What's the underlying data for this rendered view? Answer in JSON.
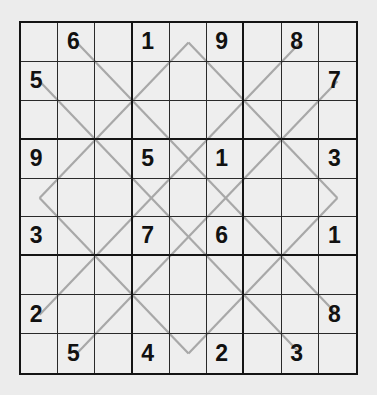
{
  "puzzle": {
    "type": "sudoku",
    "size": 9,
    "colors": {
      "background": "#ececec",
      "grid_line": "#2a2a2a",
      "box_line": "#141414",
      "diagonal_line": "#a8a8a8",
      "digit": "#111111"
    },
    "grid": [
      [
        "",
        "6",
        "",
        "1",
        "",
        "9",
        "",
        "8",
        ""
      ],
      [
        "5",
        "",
        "",
        "",
        "",
        "",
        "",
        "",
        "7"
      ],
      [
        "",
        "",
        "",
        "",
        "",
        "",
        "",
        "",
        ""
      ],
      [
        "9",
        "",
        "",
        "5",
        "",
        "1",
        "",
        "",
        "3"
      ],
      [
        "",
        "",
        "",
        "",
        "",
        "",
        "",
        "",
        ""
      ],
      [
        "3",
        "",
        "",
        "7",
        "",
        "6",
        "",
        "",
        "1"
      ],
      [
        "",
        "",
        "",
        "",
        "",
        "",
        "",
        "",
        ""
      ],
      [
        "2",
        "",
        "",
        "",
        "",
        "",
        "",
        "",
        "8"
      ],
      [
        "",
        "5",
        "",
        "4",
        "",
        "2",
        "",
        "3",
        ""
      ]
    ],
    "diagonal_segments": [
      {
        "from": [
          4.5,
          0.5
        ],
        "to": [
          8.5,
          4.5
        ]
      },
      {
        "from": [
          4.5,
          0.5
        ],
        "to": [
          0.5,
          4.5
        ]
      },
      {
        "from": [
          0.5,
          4.5
        ],
        "to": [
          4.5,
          8.5
        ]
      },
      {
        "from": [
          8.5,
          4.5
        ],
        "to": [
          4.5,
          8.5
        ]
      },
      {
        "from": [
          1.5,
          0.5
        ],
        "to": [
          8.5,
          7.5
        ]
      },
      {
        "from": [
          0.5,
          1.5
        ],
        "to": [
          7.5,
          8.5
        ]
      },
      {
        "from": [
          7.5,
          0.5
        ],
        "to": [
          0.5,
          7.5
        ]
      },
      {
        "from": [
          8.5,
          1.5
        ],
        "to": [
          1.5,
          8.5
        ]
      }
    ]
  }
}
